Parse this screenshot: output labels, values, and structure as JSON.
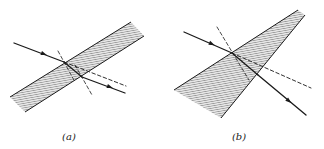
{
  "figure": {
    "colors": {
      "ink": "#1a1a1a",
      "hatch": "#555555",
      "fill": "#d8d8d8"
    },
    "panels": [
      {
        "id": "a",
        "label": "(a)",
        "label_pos": [
          69,
          131
        ],
        "description": "Ray passing through a parallel-sided plate; emergent ray parallel to incident ray but laterally displaced",
        "medium": {
          "shape": "parallel slab",
          "points": [
            [
              10,
              97
            ],
            [
              131,
              22
            ],
            [
              144,
              36
            ],
            [
              25,
              112
            ]
          ]
        },
        "incident_ray": {
          "from": [
            14,
            43
          ],
          "to": [
            64,
            62
          ],
          "arrow_at": [
            44,
            54
          ]
        },
        "refracted_ray": {
          "from": [
            64,
            62
          ],
          "to": [
            82,
            77
          ]
        },
        "emergent_ray": {
          "from": [
            82,
            77
          ],
          "to": [
            125,
            93
          ],
          "arrow_at": [
            110,
            87
          ]
        },
        "undeviated_extension": {
          "from": [
            64,
            62
          ],
          "to": [
            126,
            86
          ],
          "style": "dashed"
        },
        "normals": [
          {
            "from": [
              58,
              51
            ],
            "to": [
              75,
              82
            ],
            "style": "dashed"
          },
          {
            "from": [
              75,
              65
            ],
            "to": [
              92,
              95
            ],
            "style": "dashed"
          }
        ]
      },
      {
        "id": "b",
        "label": "(b)",
        "label_pos": [
          239,
          131
        ],
        "description": "Ray passing through a wedge (prism); emergent ray deviated from incident direction",
        "medium": {
          "shape": "wedge",
          "points": [
            [
              174,
              90
            ],
            [
              298,
              10
            ],
            [
              305,
              15
            ],
            [
              221,
              118
            ]
          ]
        },
        "incident_ray": {
          "from": [
            184,
            32
          ],
          "to": [
            232,
            53
          ],
          "arrow_at": [
            212,
            44
          ]
        },
        "refracted_ray": {
          "from": [
            232,
            53
          ],
          "to": [
            258,
            75
          ]
        },
        "emergent_ray": {
          "from": [
            258,
            75
          ],
          "to": [
            306,
            115
          ],
          "arrow_at": [
            289,
            101
          ]
        },
        "undeviated_extension": {
          "from": [
            232,
            53
          ],
          "to": [
            311,
            88
          ],
          "style": "dashed"
        },
        "normals": [
          {
            "from": [
              217,
              27
            ],
            "to": [
              249,
              80
            ],
            "style": "dashed"
          }
        ]
      }
    ]
  }
}
